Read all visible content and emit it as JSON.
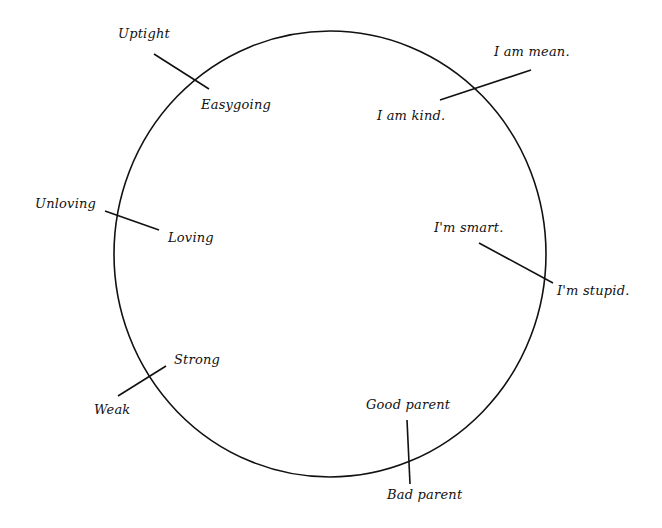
{
  "diagram": {
    "type": "self-concept circle with crossing polarity lines",
    "circle": {
      "cx": 330,
      "cy": 254,
      "rx": 216,
      "ry": 223,
      "stroke": "#111111"
    },
    "pairs": [
      {
        "id": "uptight-easygoing",
        "outside": "Uptight",
        "inside": "Easygoing",
        "line": {
          "x1": 154,
          "y1": 54,
          "x2": 209,
          "y2": 89
        }
      },
      {
        "id": "mean-kind",
        "outside": "I am mean.",
        "inside": "I am kind.",
        "line": {
          "x1": 531,
          "y1": 70,
          "x2": 440,
          "y2": 100
        }
      },
      {
        "id": "unloving-loving",
        "outside": "Unloving",
        "inside": "Loving",
        "line": {
          "x1": 105,
          "y1": 211,
          "x2": 159,
          "y2": 230
        }
      },
      {
        "id": "stupid-smart",
        "outside": "I'm stupid.",
        "inside": "I'm smart.",
        "line": {
          "x1": 553,
          "y1": 283,
          "x2": 479,
          "y2": 243
        }
      },
      {
        "id": "weak-strong",
        "outside": "Weak",
        "inside": "Strong",
        "line": {
          "x1": 118,
          "y1": 396,
          "x2": 166,
          "y2": 366
        }
      },
      {
        "id": "bad-good-parent",
        "outside": "Bad parent",
        "inside": "Good parent",
        "line": {
          "x1": 407,
          "y1": 420,
          "x2": 410,
          "y2": 484
        }
      }
    ]
  },
  "labels": {
    "uptight": "Uptight",
    "easygoing": "Easygoing",
    "mean": "I am mean.",
    "kind": "I am kind.",
    "unloving": "Unloving",
    "loving": "Loving",
    "smart": "I'm smart.",
    "stupid": "I'm stupid.",
    "strong": "Strong",
    "weak": "Weak",
    "good_parent": "Good parent",
    "bad_parent": "Bad parent"
  }
}
